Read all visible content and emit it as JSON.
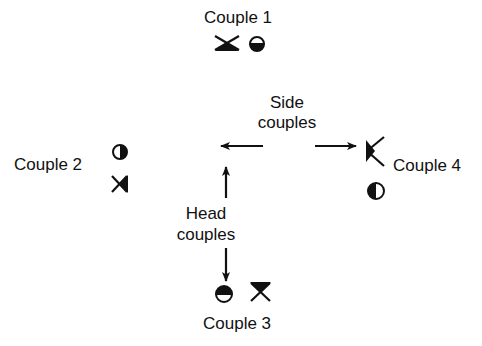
{
  "diagram": {
    "type": "square-dance-formation",
    "couples": [
      {
        "id": 1,
        "label": "Couple 1",
        "position": "top",
        "symbols": [
          "man-facing-down",
          "woman-facing-down"
        ]
      },
      {
        "id": 2,
        "label": "Couple 2",
        "position": "left",
        "symbols": [
          "woman-facing-right",
          "man-facing-right"
        ]
      },
      {
        "id": 3,
        "label": "Couple 3",
        "position": "bottom",
        "symbols": [
          "woman-facing-up",
          "man-facing-up"
        ]
      },
      {
        "id": 4,
        "label": "Couple 4",
        "position": "right",
        "symbols": [
          "man-facing-left",
          "woman-facing-left"
        ]
      }
    ],
    "annotations": {
      "side_line1": "Side",
      "side_line2": "couples",
      "head_line1": "Head",
      "head_line2": "couples"
    },
    "colors": {
      "ink": "#111111",
      "background": "#ffffff"
    }
  }
}
